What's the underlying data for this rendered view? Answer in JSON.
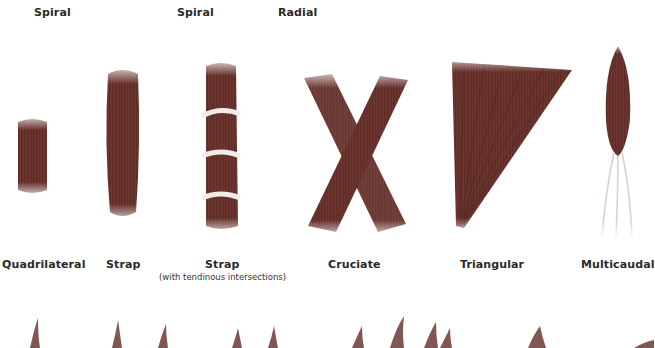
{
  "colors": {
    "muscle_dark": "#5a2a24",
    "muscle_mid": "#8a4a40",
    "muscle_light": "#b0706a",
    "tendon": "#e8e4e0",
    "background": "#ffffff",
    "text": "#2a2a2a"
  },
  "top_row_labels": [
    {
      "label": "Spiral"
    },
    {
      "label": "Spiral"
    },
    {
      "label": "Radial"
    }
  ],
  "shapes": [
    {
      "label": "Quadrilateral",
      "sublabel": ""
    },
    {
      "label": "Strap",
      "sublabel": ""
    },
    {
      "label": "Strap",
      "sublabel": "(with tendinous intersections)"
    },
    {
      "label": "Cruciate",
      "sublabel": ""
    },
    {
      "label": "Triangular",
      "sublabel": ""
    },
    {
      "label": "Multicaudal",
      "sublabel": ""
    }
  ]
}
